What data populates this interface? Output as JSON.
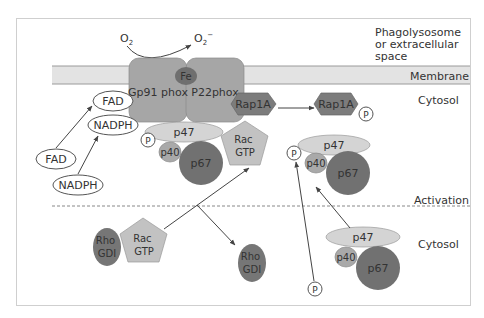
{
  "regions": {
    "extracellular": [
      "Phagolysosome",
      "or extracellular",
      "space"
    ],
    "membrane": "Membrane",
    "cytosol_top": "Cytosol",
    "activation": "Activation",
    "cytosol_bottom": "Cytosol"
  },
  "reaction": {
    "substrate": "O",
    "substrate_sub": "2",
    "product": "O",
    "product_sub": "2",
    "product_sup": "−"
  },
  "membrane_complex": {
    "gp91": "Gp91 phox",
    "p22": "P22phox",
    "heme": "Fe"
  },
  "cofactors": {
    "fad_bound": "FAD",
    "nadph_bound": "NADPH",
    "fad_free": "FAD",
    "nadph_free": "NADPH"
  },
  "rap1a": {
    "inactive": "Rap1A",
    "active": "Rap1A",
    "phospho": "P"
  },
  "active_complex": {
    "p47": "p47",
    "p40": "p40",
    "p67": "p67",
    "phospho": "P",
    "rac_line1": "Rac",
    "rac_line2": "GTP"
  },
  "intermediate_complex": {
    "p47": "p47",
    "p40": "p40",
    "p67": "p67",
    "phospho": "P"
  },
  "resting_complex": {
    "p47": "p47",
    "p40": "p40",
    "p67": "p67"
  },
  "free_phosphate": "P",
  "rho_gdi_complex": {
    "rho_line1": "Rho",
    "rho_line2": "GDI",
    "rac_line1": "Rac",
    "rac_line2": "GTP"
  },
  "free_rho_gdi": {
    "line1": "Rho",
    "line2": "GDI"
  },
  "colors": {
    "membrane_fill": "#e3e3e3",
    "phox_fill": "#a6a6a6",
    "heme_fill": "#6f6f6f",
    "rap1a_fill": "#7c7c7c",
    "p47_fill": "#d4d4d4",
    "p40_fill": "#a9a9a9",
    "p67_fill": "#717171",
    "rac_fill": "#c2c2c2",
    "rho_fill": "#767676",
    "line": "#555555",
    "frame": "#cfcfcf"
  }
}
